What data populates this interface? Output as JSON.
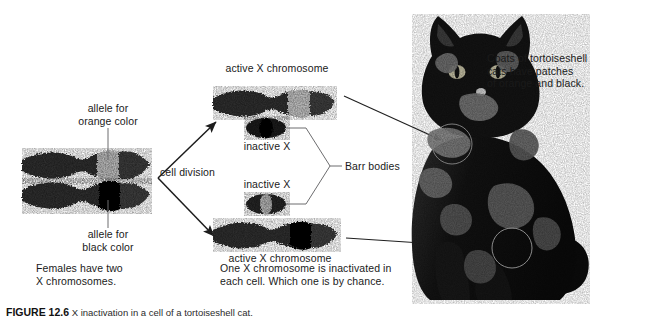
{
  "figure": {
    "background_color": "#ffffff",
    "text_color": "#1a1a1a",
    "line_color": "#58585a"
  },
  "labels": {
    "allele_orange": "allele for\norange color",
    "allele_black": "allele for\nblack color",
    "females_caption": "Females have two\nX chromosomes.",
    "cell_division": "cell division",
    "active_x_top": "active X chromosome",
    "active_x_bottom": "active X chromosome",
    "inactive_x_top": "inactive X",
    "inactive_x_bottom": "inactive X",
    "barr_bodies": "Barr bodies",
    "inactivation_caption": "One X chromosome is inactivated in\neach cell. Which one is by chance.",
    "coats_caption": "Coats of tortoiseshell\ncats have patches\nof orange and black."
  },
  "bottom_caption": {
    "figure_number": "FIGURE 12.6",
    "text": "X inactivation in a cell of a tortoiseshell cat."
  },
  "chromosomes": {
    "maternal_pair": [
      {
        "name": "x-chromosome-orange-allele",
        "band": "light",
        "band_label": "orange color allele"
      },
      {
        "name": "x-chromosome-black-allele",
        "band": "dark",
        "band_label": "black color allele"
      }
    ],
    "daughter_cell_top": {
      "active": {
        "name": "active-x-chromosome",
        "band": "light"
      },
      "inactive": {
        "name": "inactive-x-barr-body",
        "band": "dark"
      }
    },
    "daughter_cell_bottom": {
      "active": {
        "name": "active-x-chromosome",
        "band": "dark"
      },
      "inactive": {
        "name": "inactive-x-barr-body",
        "band": "light"
      }
    }
  },
  "cat": {
    "alt": "tortoiseshell cat sitting, black coat with orange patches",
    "highlight_patches": [
      {
        "name": "shoulder-patch-circle"
      },
      {
        "name": "flank-patch-circle"
      }
    ]
  }
}
